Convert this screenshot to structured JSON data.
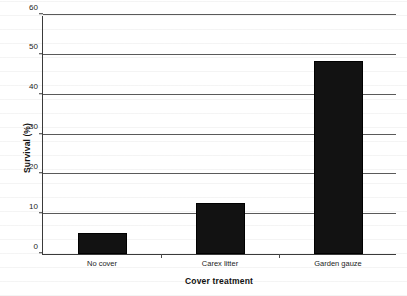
{
  "chart_data": {
    "type": "bar",
    "title": "",
    "categories": [
      "No cover",
      "Carex litter",
      "Garden gauze"
    ],
    "values": [
      5.2,
      12.7,
      48.4
    ],
    "series": [
      {
        "name": "Survival",
        "values": [
          5.2,
          12.7,
          48.4
        ]
      }
    ],
    "xlabel": "Cover treatment",
    "ylabel": "Survival (%)",
    "ylim": [
      0,
      60
    ],
    "ytick_labels": [
      "0",
      "10",
      "20",
      "30",
      "40",
      "50",
      "60"
    ],
    "ytick_values": [
      0,
      10,
      20,
      30,
      40,
      50,
      60
    ],
    "grid": true,
    "legend": null,
    "bar_color": "#121212",
    "gridline_color": "#5a5a5a",
    "axis_color": "#3a3a3a",
    "background_color": "#ffffff"
  }
}
